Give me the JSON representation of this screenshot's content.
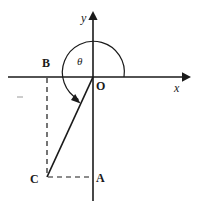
{
  "figure": {
    "type": "geometry-diagram",
    "background_color": "#ffffff",
    "stroke_color": "#1a1a1a",
    "axes": {
      "x_axis_label": "x",
      "y_axis_label": "y",
      "origin_label": "O",
      "x_axis_arrow": "right",
      "y_axis_arrow": "up"
    },
    "angle": {
      "symbol": "θ",
      "arc_direction": "counterclockwise",
      "arc_start": "positive x-axis",
      "arc_end": "ray OC",
      "arrowhead": "at ray OC end"
    },
    "points": [
      {
        "name": "O",
        "label": "O",
        "role": "origin"
      },
      {
        "name": "A",
        "label": "A",
        "role": "foot on negative y-axis"
      },
      {
        "name": "B",
        "label": "B",
        "role": "foot on negative x-axis"
      },
      {
        "name": "C",
        "label": "C",
        "role": "terminal point in third quadrant"
      }
    ],
    "segments": [
      {
        "name": "OC",
        "style": "solid",
        "from": "O",
        "to": "C"
      },
      {
        "name": "BC",
        "style": "dashed",
        "from": "B",
        "to": "C"
      },
      {
        "name": "CA",
        "style": "dashed",
        "from": "C",
        "to": "A"
      }
    ]
  }
}
